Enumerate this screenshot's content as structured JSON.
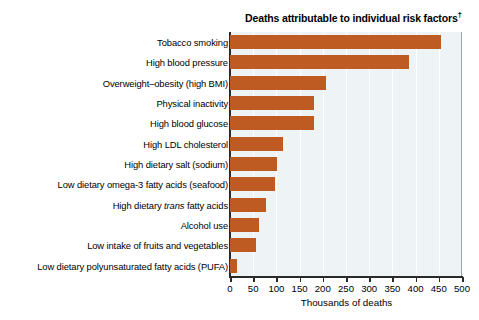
{
  "chart_data": {
    "type": "bar",
    "orientation": "horizontal",
    "title": "Deaths attributable to individual risk factors",
    "title_superscript": "†",
    "xlabel": "Thousands of deaths",
    "ylabel": "",
    "xlim": [
      0,
      500
    ],
    "xticks": [
      0,
      50,
      100,
      150,
      200,
      250,
      300,
      350,
      400,
      450,
      500
    ],
    "xticklabels": [
      "0",
      "50",
      "100",
      "150",
      "200",
      "250",
      "300",
      "350",
      "400",
      "450",
      "500"
    ],
    "grid": true,
    "grid_axis": "x",
    "legend": false,
    "bar_color": "#bd5b23",
    "plot_background": "#eef3f6",
    "categories": [
      "Tobacco smoking",
      "High blood pressure",
      "Overweight–obesity (high BMI)",
      "Physical inactivity",
      "High blood glucose",
      "High LDL cholesterol",
      "High dietary salt (sodium)",
      "Low dietary omega-3 fatty acids (seafood)",
      "High dietary trans fatty acids",
      "Alcohol use",
      "Low intake of fruits and vegetables",
      "Low dietary polyunsaturated fatty acids (PUFA)"
    ],
    "values": [
      455,
      385,
      207,
      182,
      181,
      114,
      101,
      97,
      78,
      62,
      57,
      15
    ]
  },
  "labels": [
    {
      "pre": "Tobacco smoking",
      "em": "",
      "post": ""
    },
    {
      "pre": "High blood pressure",
      "em": "",
      "post": ""
    },
    {
      "pre": "Overweight–obesity (high BMI)",
      "em": "",
      "post": ""
    },
    {
      "pre": "Physical inactivity",
      "em": "",
      "post": ""
    },
    {
      "pre": "High blood glucose",
      "em": "",
      "post": ""
    },
    {
      "pre": "High LDL cholesterol",
      "em": "",
      "post": ""
    },
    {
      "pre": "High dietary salt (sodium)",
      "em": "",
      "post": ""
    },
    {
      "pre": "Low dietary omega-3 fatty acids (seafood)",
      "em": "",
      "post": ""
    },
    {
      "pre": "High dietary ",
      "em": "trans",
      "post": " fatty acids"
    },
    {
      "pre": "Alcohol use",
      "em": "",
      "post": ""
    },
    {
      "pre": "Low intake of fruits and vegetables",
      "em": "",
      "post": ""
    },
    {
      "pre": "Low dietary polyunsaturated fatty acids (PUFA)",
      "em": "",
      "post": ""
    }
  ]
}
